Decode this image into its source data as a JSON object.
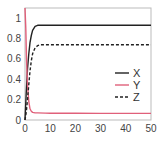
{
  "chart_data": {
    "type": "line",
    "title": "",
    "xlabel": "",
    "ylabel": "",
    "xlim": [
      0,
      50
    ],
    "ylim": [
      0,
      1.1
    ],
    "xticks": [
      0,
      10,
      20,
      30,
      40,
      50
    ],
    "xtick_labels": [
      "0",
      "10",
      "20",
      "30",
      "40",
      "50"
    ],
    "yticks": [
      0,
      0.2,
      0.4,
      0.6,
      0.8,
      1
    ],
    "ytick_labels": [
      "0",
      "0.2",
      "0.4",
      "0.6",
      "0.8",
      "1"
    ],
    "grid": false,
    "legend": "center-right",
    "series": [
      {
        "name": "X",
        "color": "#222222",
        "dash": "solid",
        "x": [
          0,
          0.5,
          1,
          1.5,
          2,
          2.5,
          3,
          4,
          5,
          6,
          8,
          10,
          20,
          30,
          40,
          50
        ],
        "y": [
          0,
          0.28,
          0.5,
          0.65,
          0.76,
          0.83,
          0.88,
          0.92,
          0.93,
          0.93,
          0.93,
          0.93,
          0.93,
          0.93,
          0.93,
          0.93
        ]
      },
      {
        "name": "Y",
        "color": "#e0607a",
        "dash": "solid",
        "x": [
          0,
          0.3,
          0.6,
          1,
          1.5,
          2,
          2.5,
          3,
          4,
          5,
          8,
          10,
          20,
          30,
          40,
          50
        ],
        "y": [
          1.1,
          0.9,
          0.6,
          0.35,
          0.18,
          0.11,
          0.085,
          0.075,
          0.07,
          0.07,
          0.068,
          0.067,
          0.066,
          0.065,
          0.065,
          0.065
        ]
      },
      {
        "name": "Z",
        "color": "#222222",
        "dash": "dashed",
        "x": [
          0,
          0.5,
          1,
          1.5,
          2,
          2.5,
          3,
          4,
          5,
          6,
          8,
          10,
          20,
          30,
          40,
          50
        ],
        "y": [
          0,
          0.08,
          0.2,
          0.35,
          0.48,
          0.58,
          0.65,
          0.71,
          0.73,
          0.74,
          0.74,
          0.74,
          0.74,
          0.74,
          0.74,
          0.74
        ]
      }
    ]
  }
}
